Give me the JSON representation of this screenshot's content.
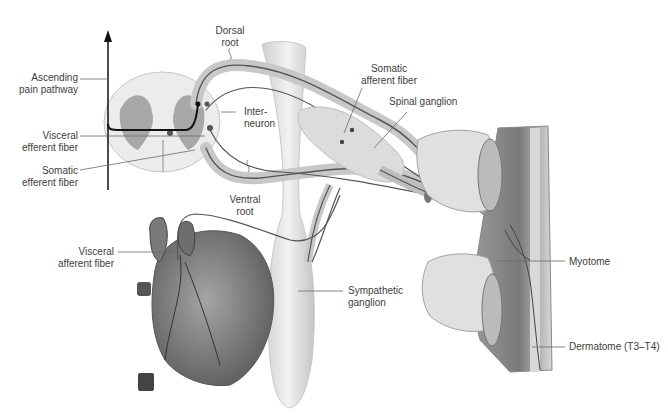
{
  "figure": {
    "type": "anatomical-illustration",
    "labels": {
      "dorsal_root": "Dorsal\nroot",
      "ascending_pain_pathway": "Ascending\npain pathway",
      "somatic_afferent_fiber": "Somatic\nafferent fiber",
      "spinal_ganglion": "Spinal ganglion",
      "interneuron": "Inter-\nneuron",
      "visceral_efferent_fiber": "Visceral\nefferent fiber",
      "somatic_efferent_fiber": "Somatic\nefferent fiber",
      "ventral_root": "Ventral\nroot",
      "visceral_afferent_fiber": "Visceral\nafferent fiber",
      "sympathetic_ganglion": "Sympathetic\nganglion",
      "myotome": "Myotome",
      "dermatome": "Dermatome (T3–T4)"
    },
    "colors": {
      "nerve": "#555555",
      "pain_pathway": "#111111",
      "tissue_light": "#e6e6e6",
      "tissue_mid": "#b8b8b8",
      "heart": "#8a8a8a",
      "leader_line": "#6a6a6a"
    }
  }
}
